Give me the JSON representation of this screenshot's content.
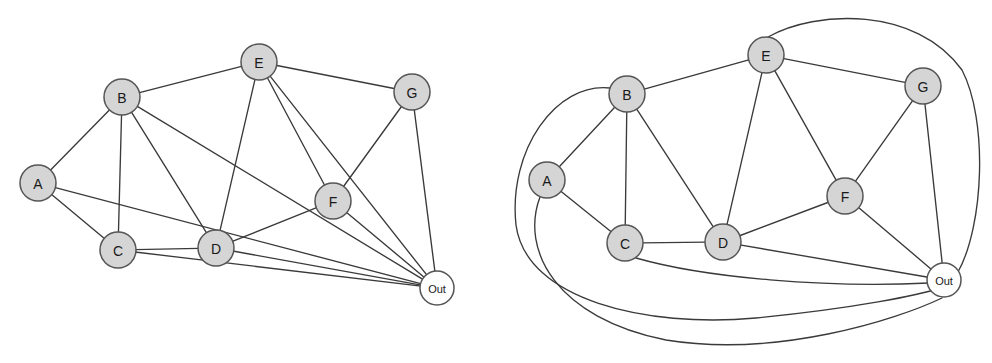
{
  "figure": {
    "title": "",
    "background_color": "#ffffff",
    "panel_count": 2
  },
  "style": {
    "node_fill": "#d5d5d5",
    "node_fill_terminal": "#ffffff",
    "node_stroke": "#555555",
    "edge_stroke": "#3a3a3a",
    "label_color": "#1a1a1a",
    "node_radius": 18,
    "terminal_radius": 17,
    "edge_width": 1.35
  },
  "chart_data": {
    "type": "diagram",
    "subtype": "graph",
    "title": "",
    "vertices": [
      "A",
      "B",
      "C",
      "D",
      "E",
      "F",
      "G",
      "Out"
    ],
    "edges": [
      [
        "A",
        "B"
      ],
      [
        "A",
        "C"
      ],
      [
        "A",
        "Out"
      ],
      [
        "B",
        "C"
      ],
      [
        "B",
        "D"
      ],
      [
        "B",
        "E"
      ],
      [
        "B",
        "Out"
      ],
      [
        "C",
        "D"
      ],
      [
        "C",
        "Out"
      ],
      [
        "D",
        "E"
      ],
      [
        "D",
        "F"
      ],
      [
        "D",
        "Out"
      ],
      [
        "E",
        "F"
      ],
      [
        "E",
        "G"
      ],
      [
        "E",
        "Out"
      ],
      [
        "F",
        "G"
      ],
      [
        "F",
        "Out"
      ],
      [
        "G",
        "Out"
      ]
    ],
    "edge_count": 18,
    "vertex_count": 8
  },
  "panels": {
    "left": {
      "name": "straight-line-drawing",
      "nodes": [
        {
          "id": "A",
          "label": "A",
          "x": 38,
          "y": 183,
          "r": 18,
          "terminal": false
        },
        {
          "id": "B",
          "label": "B",
          "x": 122,
          "y": 97,
          "r": 18,
          "terminal": false
        },
        {
          "id": "C",
          "label": "C",
          "x": 118,
          "y": 250,
          "r": 18,
          "terminal": false
        },
        {
          "id": "D",
          "label": "D",
          "x": 216,
          "y": 248,
          "r": 18,
          "terminal": false
        },
        {
          "id": "E",
          "label": "E",
          "x": 259,
          "y": 62,
          "r": 18,
          "terminal": false
        },
        {
          "id": "F",
          "label": "F",
          "x": 333,
          "y": 201,
          "r": 18,
          "terminal": false
        },
        {
          "id": "G",
          "label": "G",
          "x": 412,
          "y": 92,
          "r": 18,
          "terminal": false
        },
        {
          "id": "Out",
          "label": "Out",
          "x": 437,
          "y": 288,
          "r": 17,
          "terminal": true
        }
      ],
      "edges": [
        {
          "from": "A",
          "to": "B"
        },
        {
          "from": "A",
          "to": "C"
        },
        {
          "from": "A",
          "to": "Out"
        },
        {
          "from": "B",
          "to": "C"
        },
        {
          "from": "B",
          "to": "D"
        },
        {
          "from": "B",
          "to": "E"
        },
        {
          "from": "B",
          "to": "Out"
        },
        {
          "from": "C",
          "to": "D"
        },
        {
          "from": "C",
          "to": "Out"
        },
        {
          "from": "D",
          "to": "E"
        },
        {
          "from": "D",
          "to": "F"
        },
        {
          "from": "D",
          "to": "Out"
        },
        {
          "from": "E",
          "to": "F"
        },
        {
          "from": "E",
          "to": "G"
        },
        {
          "from": "E",
          "to": "Out"
        },
        {
          "from": "F",
          "to": "G"
        },
        {
          "from": "F",
          "to": "Out"
        },
        {
          "from": "G",
          "to": "Out"
        }
      ]
    },
    "right": {
      "name": "planar-embedding",
      "nodes": [
        {
          "id": "A",
          "label": "A",
          "x": 51,
          "y": 180,
          "r": 18,
          "terminal": false
        },
        {
          "id": "B",
          "label": "B",
          "x": 131,
          "y": 94,
          "r": 18,
          "terminal": false
        },
        {
          "id": "C",
          "label": "C",
          "x": 129,
          "y": 243,
          "r": 18,
          "terminal": false
        },
        {
          "id": "D",
          "label": "D",
          "x": 227,
          "y": 242,
          "r": 18,
          "terminal": false
        },
        {
          "id": "E",
          "label": "E",
          "x": 270,
          "y": 55,
          "r": 18,
          "terminal": false
        },
        {
          "id": "F",
          "label": "F",
          "x": 349,
          "y": 196,
          "r": 18,
          "terminal": false
        },
        {
          "id": "G",
          "label": "G",
          "x": 427,
          "y": 86,
          "r": 18,
          "terminal": false
        },
        {
          "id": "Out",
          "label": "Out",
          "x": 448,
          "y": 280,
          "r": 17,
          "terminal": true
        }
      ],
      "edges": [
        {
          "from": "A",
          "to": "B",
          "curved": false
        },
        {
          "from": "A",
          "to": "C",
          "curved": false
        },
        {
          "from": "A",
          "to": "Out",
          "curved": true,
          "path": "M 44 197 C 24 250, 60 318, 170 340 C 280 358, 400 320, 446 298"
        },
        {
          "from": "B",
          "to": "C",
          "curved": false
        },
        {
          "from": "B",
          "to": "D",
          "curved": false
        },
        {
          "from": "B",
          "to": "E",
          "curved": false
        },
        {
          "from": "B",
          "to": "Out",
          "curved": true,
          "path": "M 114 88 C 60 82, 12 150, 20 225 C 30 300, 150 328, 260 318 C 360 308, 424 295, 444 288"
        },
        {
          "from": "C",
          "to": "D",
          "curved": false
        },
        {
          "from": "C",
          "to": "Out",
          "curved": true,
          "path": "M 140 258 C 210 278, 330 288, 433 283"
        },
        {
          "from": "D",
          "to": "E",
          "curved": false
        },
        {
          "from": "D",
          "to": "F",
          "curved": false
        },
        {
          "from": "D",
          "to": "Out",
          "curved": false
        },
        {
          "from": "E",
          "to": "F",
          "curved": false
        },
        {
          "from": "E",
          "to": "G",
          "curved": false
        },
        {
          "from": "E",
          "to": "Out",
          "curved": true,
          "path": "M 272 37 C 320 10, 420 6, 466 70 C 492 120, 488 225, 462 272"
        },
        {
          "from": "F",
          "to": "G",
          "curved": false
        },
        {
          "from": "F",
          "to": "Out",
          "curved": false
        },
        {
          "from": "G",
          "to": "Out",
          "curved": false
        }
      ]
    }
  }
}
